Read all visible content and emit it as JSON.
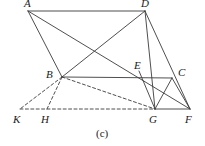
{
  "figure": {
    "caption": "(c)",
    "caption_pos": {
      "x": 96,
      "y": 128
    },
    "width": 205,
    "height": 146,
    "stroke_color": "#3b3b3b",
    "background": "#ffffff",
    "stroke_width": 0.9,
    "dash_pattern": "3,2.4"
  },
  "points": {
    "A": {
      "label": "A",
      "x": 28,
      "y": 11,
      "lx": 24,
      "ly": -2
    },
    "D": {
      "label": "D",
      "x": 145,
      "y": 11,
      "lx": 141,
      "ly": -2
    },
    "B": {
      "label": "B",
      "x": 62,
      "y": 77,
      "lx": 46,
      "ly": 69
    },
    "E": {
      "label": "E",
      "x": 143,
      "y": 78,
      "lx": 134,
      "ly": 60
    },
    "C": {
      "label": "C",
      "x": 172,
      "y": 78,
      "lx": 178,
      "ly": 67
    },
    "K": {
      "label": "K",
      "x": 20,
      "y": 109,
      "lx": 13,
      "ly": 114
    },
    "H": {
      "label": "H",
      "x": 47,
      "y": 109,
      "lx": 41,
      "ly": 114
    },
    "G": {
      "label": "G",
      "x": 155,
      "y": 109,
      "lx": 149,
      "ly": 114
    },
    "F": {
      "label": "F",
      "x": 190,
      "y": 109,
      "lx": 185,
      "ly": 114
    }
  },
  "solid_segments": [
    {
      "name": "segment-AD",
      "x1": 28,
      "y1": 11,
      "x2": 145,
      "y2": 11
    },
    {
      "name": "segment-AB",
      "x1": 28,
      "y1": 11,
      "x2": 62,
      "y2": 77
    },
    {
      "name": "segment-AF",
      "x1": 28,
      "y1": 11,
      "x2": 190,
      "y2": 109
    },
    {
      "name": "segment-DB",
      "x1": 145,
      "y1": 11,
      "x2": 62,
      "y2": 77
    },
    {
      "name": "segment-DG",
      "x1": 145,
      "y1": 11,
      "x2": 155,
      "y2": 109
    },
    {
      "name": "segment-DF",
      "x1": 145,
      "y1": 11,
      "x2": 190,
      "y2": 109
    },
    {
      "name": "segment-BC",
      "x1": 62,
      "y1": 77,
      "x2": 172,
      "y2": 78
    },
    {
      "name": "segment-CG",
      "x1": 172,
      "y1": 78,
      "x2": 155,
      "y2": 109
    },
    {
      "name": "segment-CF",
      "x1": 172,
      "y1": 78,
      "x2": 190,
      "y2": 109
    },
    {
      "name": "segment-EG",
      "x1": 139,
      "y1": 71,
      "x2": 155,
      "y2": 109
    },
    {
      "name": "segment-GF",
      "x1": 155,
      "y1": 109,
      "x2": 190,
      "y2": 109
    }
  ],
  "dashed_segments": [
    {
      "name": "segment-BK",
      "x1": 62,
      "y1": 77,
      "x2": 20,
      "y2": 109
    },
    {
      "name": "segment-BH",
      "x1": 62,
      "y1": 77,
      "x2": 47,
      "y2": 109
    },
    {
      "name": "segment-BG",
      "x1": 62,
      "y1": 77,
      "x2": 155,
      "y2": 109
    },
    {
      "name": "segment-KG-baseline",
      "x1": 20,
      "y1": 109,
      "x2": 155,
      "y2": 109
    }
  ]
}
